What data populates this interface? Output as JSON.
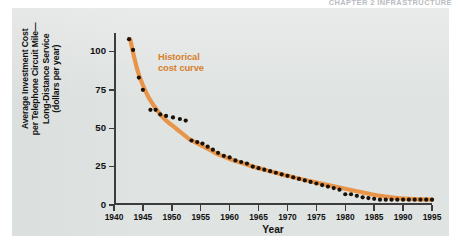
{
  "running_head": "CHAPTER 2  INFRASTRUCTURE",
  "figure": {
    "ylabel": "Average Investment Cost\nper Telephone Circuit Mile—\nLong-Distance Service\n(dollars per year)",
    "xlabel": "Year",
    "annotation": "Historical\ncost curve",
    "annotation_color": "#d8802c",
    "curve_color": "#e8954a",
    "point_color": "#1a1208",
    "panel_color": "#dfe3e1",
    "axis_color": "#3c3c3c"
  },
  "chart_data": {
    "type": "scatter",
    "title": "",
    "subtitle": "",
    "xlabel": "Year",
    "ylabel": "Average Investment Cost per Telephone Circuit Mile—Long-Distance Service (dollars per year)",
    "xlim": [
      1940,
      1995
    ],
    "ylim": [
      0,
      112
    ],
    "xticks": [
      1940,
      1945,
      1950,
      1955,
      1960,
      1965,
      1970,
      1975,
      1980,
      1985,
      1990,
      1995
    ],
    "xtick_labels": [
      "1940",
      "1945",
      "1950",
      "1955",
      "1960",
      "1965",
      "1970",
      "1975",
      "1980",
      "1985",
      "1990",
      "1995"
    ],
    "yticks": [
      0,
      25,
      50,
      75,
      100
    ],
    "ytick_labels": [
      "0",
      "25",
      "50",
      "75",
      "100"
    ],
    "grid": false,
    "legend": "none",
    "annotations": [
      {
        "text": "Historical cost curve",
        "x": 1949.5,
        "y": 92,
        "color": "#d8802c"
      }
    ],
    "series": [
      {
        "name": "Observed investment cost (data points)",
        "type": "scatter",
        "marker": "circle",
        "color": "#1a1208",
        "x": [
          1942.6,
          1943.3,
          1944.3,
          1945.0,
          1946.3,
          1947.2,
          1948.0,
          1949.0,
          1950.2,
          1951.4,
          1952.4,
          1953.4,
          1954.4,
          1955.3,
          1956.2,
          1957.1,
          1958.0,
          1959.0,
          1960.0,
          1961.0,
          1962.0,
          1963.0,
          1964.0,
          1965.0,
          1966.0,
          1967.0,
          1968.0,
          1969.0,
          1970.0,
          1971.0,
          1972.0,
          1973.0,
          1974.0,
          1975.0,
          1976.0,
          1977.0,
          1978.0,
          1979.0,
          1980.0,
          1981.0,
          1982.0,
          1983.0,
          1984.0,
          1985.0,
          1986.0,
          1987.0,
          1988.0,
          1989.0,
          1990.0,
          1991.0,
          1992.0,
          1993.0,
          1994.0,
          1995.0
        ],
        "y": [
          108,
          101,
          83,
          75,
          62,
          62,
          59,
          58,
          57,
          56,
          55,
          42,
          41,
          40,
          38,
          36,
          34,
          32,
          31,
          29,
          28,
          27,
          25,
          24,
          23,
          22,
          21,
          20,
          19,
          18,
          17,
          16,
          15,
          14,
          13,
          12,
          11,
          10,
          7,
          7,
          6,
          5,
          4.5,
          4,
          3.5,
          3.5,
          3.5,
          3.5,
          3.5,
          3.5,
          3.5,
          3.5,
          3.5,
          3.5
        ]
      },
      {
        "name": "Historical cost curve (fitted)",
        "type": "line",
        "color": "#e8954a",
        "x": [
          1942.8,
          1943.5,
          1944.2,
          1945.0,
          1946.0,
          1947.0,
          1948.0,
          1949.0,
          1950.0,
          1951.0,
          1952.0,
          1953.0,
          1954.0,
          1955.0,
          1956.0,
          1957.0,
          1958.0,
          1959.0,
          1960.0,
          1962.0,
          1964.0,
          1966.0,
          1968.0,
          1970.0,
          1972.0,
          1974.0,
          1976.0,
          1978.0,
          1980.0,
          1982.0,
          1984.0,
          1986.0,
          1988.0,
          1990.0,
          1992.0,
          1995.0
        ],
        "y": [
          108,
          96,
          86,
          78,
          70,
          64,
          59,
          55,
          52,
          49,
          46,
          43,
          41,
          39,
          37,
          35,
          33,
          31.5,
          30,
          27.5,
          25,
          23,
          21,
          19,
          17.2,
          15.5,
          13.8,
          12.2,
          10.6,
          9.0,
          7.4,
          6.0,
          5.0,
          4.2,
          3.8,
          3.5
        ]
      }
    ]
  }
}
